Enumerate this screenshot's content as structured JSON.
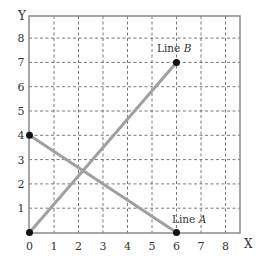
{
  "chart_data": {
    "type": "line",
    "title": "",
    "xlabel": "X",
    "ylabel": "Y",
    "xlim": [
      0,
      8.5
    ],
    "ylim": [
      0,
      8.5
    ],
    "x_ticks": [
      "0",
      "1",
      "2",
      "3",
      "4",
      "5",
      "6",
      "7",
      "8"
    ],
    "y_ticks": [
      "1",
      "2",
      "3",
      "4",
      "5",
      "6",
      "7",
      "8"
    ],
    "grid": true,
    "grid_style": "dashed",
    "series": [
      {
        "name": "Line A",
        "label_main": "Line ",
        "label_italic": "A",
        "points": [
          [
            0,
            4
          ],
          [
            6,
            0
          ]
        ]
      },
      {
        "name": "Line B",
        "label_main": "Line ",
        "label_italic": "B",
        "points": [
          [
            0,
            0
          ],
          [
            6,
            7
          ]
        ]
      }
    ],
    "colors": {
      "line": "#a0a0a0",
      "point": "#111111",
      "grid": "#555555",
      "axis": "#888888"
    }
  }
}
